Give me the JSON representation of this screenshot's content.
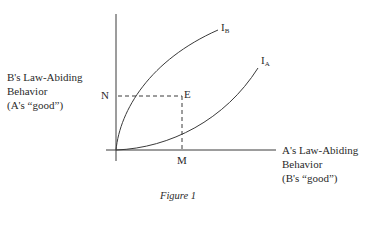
{
  "figure": {
    "caption": "Figure 1",
    "y_axis_label": [
      "B's Law-Abiding",
      "Behavior",
      "(A's “good”)"
    ],
    "x_axis_label": [
      "A's Law-Abiding",
      "Behavior",
      "(B's “good”)"
    ],
    "points": {
      "N": "N",
      "E": "E",
      "M": "M"
    },
    "curves": [
      {
        "name": "I",
        "sub": "B"
      },
      {
        "name": "I",
        "sub": "A"
      }
    ]
  }
}
